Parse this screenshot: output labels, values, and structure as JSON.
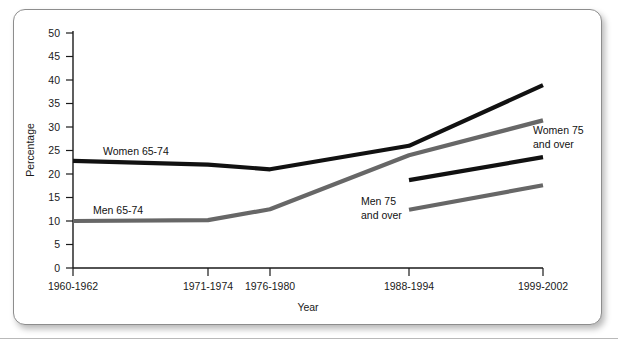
{
  "figure": {
    "name": "line-chart-obesity-by-age-sex"
  },
  "chart_data": {
    "type": "line",
    "title": "",
    "xlabel": "Year",
    "ylabel": "Percentage",
    "ylim": [
      0,
      50
    ],
    "ytick_step": 5,
    "yticks": [
      "0",
      "5",
      "10",
      "15",
      "20",
      "25",
      "30",
      "35",
      "40",
      "45",
      "50"
    ],
    "categories": [
      "1960-1962",
      "1971-1974",
      "1976-1980",
      "1988-1994",
      "1999-2002"
    ],
    "grid": false,
    "legend": "inline-labels",
    "series": [
      {
        "name": "Women 65-74",
        "color": "#111111",
        "label": "Women 65-74",
        "x": [
          "1960-1962",
          "1971-1974",
          "1976-1980",
          "1988-1994",
          "1999-2002"
        ],
        "values": [
          22.8,
          22.0,
          21.0,
          26.0,
          38.9
        ]
      },
      {
        "name": "Men 65-74",
        "color": "#676767",
        "label": "Men 65-74",
        "x": [
          "1960-1962",
          "1971-1974",
          "1976-1980",
          "1988-1994",
          "1999-2002"
        ],
        "values": [
          10.0,
          10.2,
          12.5,
          24.0,
          31.4
        ]
      },
      {
        "name": "Women 75 and over",
        "color": "#111111",
        "label": "Women 75\nand over",
        "label_line1": "Women 75",
        "label_line2": "and over",
        "x": [
          "1988-1994",
          "1999-2002"
        ],
        "values": [
          18.7,
          23.6
        ]
      },
      {
        "name": "Men 75 and over",
        "color": "#676767",
        "label": "Men 75\nand over",
        "label_line1": "Men 75",
        "label_line2": "and over",
        "x": [
          "1988-1994",
          "1999-2002"
        ],
        "values": [
          12.4,
          17.6
        ]
      }
    ]
  },
  "axes": {
    "y_title": "Percentage",
    "x_title": "Year",
    "y_tick_0": "0",
    "y_tick_5": "5",
    "y_tick_10": "10",
    "y_tick_15": "15",
    "y_tick_20": "20",
    "y_tick_25": "25",
    "y_tick_30": "30",
    "y_tick_35": "35",
    "y_tick_40": "40",
    "y_tick_45": "45",
    "y_tick_50": "50",
    "x_tick_1": "1960-1962",
    "x_tick_2": "1971-1974",
    "x_tick_3": "1976-1980",
    "x_tick_4": "1988-1994",
    "x_tick_5": "1999-2002"
  },
  "series_labels": {
    "women_65_74": "Women 65-74",
    "men_65_74": "Men 65-74",
    "women_75_l1": "Women 75",
    "women_75_l2": "and over",
    "men_75_l1": "Men 75",
    "men_75_l2": "and over"
  },
  "colors": {
    "dark_series": "#111111",
    "gray_series": "#676767",
    "axis": "#1a1a1a",
    "card_border": "#8d8d8d",
    "background": "#ffffff"
  }
}
